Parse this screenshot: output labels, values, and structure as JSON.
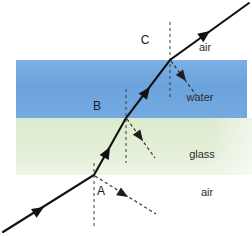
{
  "figure": {
    "canvas": {
      "width": 252,
      "height": 236,
      "background": "#ffffff"
    }
  },
  "media": [
    {
      "key": "air_bottom",
      "label": "air",
      "label_x": 207,
      "label_y": 196,
      "band": null,
      "color": "#ffffff"
    },
    {
      "key": "glass",
      "label": "glass",
      "label_x": 202,
      "label_y": 158,
      "band": {
        "x": 16,
        "y": 118,
        "width": 236,
        "height": 57
      },
      "color": "#dfead0"
    },
    {
      "key": "water",
      "label": "water",
      "label_x": 200,
      "label_y": 101,
      "band": {
        "x": 16,
        "y": 60,
        "width": 231,
        "height": 58
      },
      "color": "#6ba3dd"
    },
    {
      "key": "air_top",
      "label": "air",
      "label_x": 205,
      "label_y": 51,
      "band": null,
      "color": "#ffffff"
    }
  ],
  "interface_points": [
    {
      "id": "A",
      "label": "A",
      "x": 94,
      "y": 175,
      "label_x": 101,
      "label_y": 195,
      "between": "air-glass"
    },
    {
      "id": "B",
      "label": "B",
      "x": 126,
      "y": 118,
      "label_x": 97,
      "label_y": 110,
      "between": "glass-water"
    },
    {
      "id": "C",
      "label": "C",
      "x": 170,
      "y": 60,
      "label_x": 145,
      "label_y": 44,
      "between": "water-air"
    }
  ],
  "refracted_path": {
    "description": "Incident ray from lower-left refracts at A, B and C and exits upper-right",
    "points": [
      {
        "x": 3,
        "y": 232
      },
      {
        "x": 94,
        "y": 175
      },
      {
        "x": 126,
        "y": 118
      },
      {
        "x": 170,
        "y": 60
      },
      {
        "x": 249,
        "y": 3
      }
    ],
    "direction_arrows": [
      {
        "x": 42,
        "y": 208,
        "angle": -32
      },
      {
        "x": 108,
        "y": 149,
        "angle": -61
      },
      {
        "x": 148,
        "y": 89,
        "angle": -53
      },
      {
        "x": 208,
        "y": 32,
        "angle": -36
      }
    ]
  },
  "normals": [
    {
      "at": "A",
      "x": 94,
      "y_top": 163,
      "y_bottom": 226
    },
    {
      "at": "B",
      "x": 126,
      "y_top": 89,
      "y_bottom": 163
    },
    {
      "at": "C",
      "x": 170,
      "y_top": 22,
      "y_bottom": 98
    }
  ],
  "reflected_rays": [
    {
      "at": "A",
      "from": {
        "x": 95,
        "y": 176
      },
      "to": {
        "x": 156,
        "y": 214
      },
      "arrow": {
        "x": 126,
        "y": 195,
        "angle": 31
      }
    },
    {
      "at": "B",
      "from": {
        "x": 127,
        "y": 119
      },
      "to": {
        "x": 155,
        "y": 158
      },
      "arrow": {
        "x": 141,
        "y": 138,
        "angle": 54
      }
    },
    {
      "at": "C",
      "from": {
        "x": 171,
        "y": 61
      },
      "to": {
        "x": 196,
        "y": 95
      },
      "arrow": {
        "x": 184,
        "y": 79,
        "angle": 53
      }
    }
  ],
  "colors": {
    "water": "#6ba3dd",
    "water_edge": "#7fb2e4",
    "glass": "#dfead0",
    "glass_light": "#eef4e4",
    "ray": "#111111",
    "dashed": "#2a2a2a",
    "text": "#2b2b2b",
    "background": "#ffffff"
  }
}
